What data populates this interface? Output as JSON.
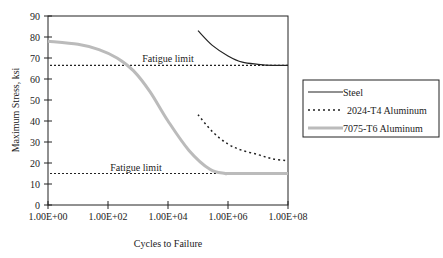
{
  "chart_data": {
    "type": "line",
    "title": "",
    "xlabel": "Cycles to Failure",
    "ylabel": "Maximum Stress, ksi",
    "x_scale": "log",
    "xlim": [
      1,
      100000000
    ],
    "ylim": [
      0,
      90
    ],
    "x_ticks": [
      "1.00E+00",
      "1.00E+02",
      "1.00E+04",
      "1.00E+06",
      "1.00E+08"
    ],
    "y_ticks": [
      0,
      10,
      20,
      30,
      40,
      50,
      60,
      70,
      80,
      90
    ],
    "grid": false,
    "legend_position": "right",
    "series": [
      {
        "name": "Steel",
        "style": "solid",
        "color": "#222222",
        "x": [
          100000,
          300000,
          1000000,
          3000000,
          10000000,
          30000000,
          100000000
        ],
        "y": [
          83,
          76,
          71,
          68,
          67,
          66.5,
          66.5
        ]
      },
      {
        "name": "2024-T4 Aluminum",
        "style": "dotted",
        "color": "#222222",
        "x": [
          100000,
          300000,
          1000000,
          3000000,
          10000000,
          30000000,
          100000000
        ],
        "y": [
          43,
          35,
          29,
          26,
          24,
          22,
          21
        ]
      },
      {
        "name": "7075-T6 Aluminum",
        "style": "solid-thick",
        "color": "#bbbbbb",
        "x": [
          1,
          10,
          50,
          200,
          700,
          2500,
          10000,
          50000,
          250000,
          800000,
          1000000,
          10000000,
          100000000
        ],
        "y": [
          78,
          76.5,
          74,
          70,
          64,
          54,
          40,
          26,
          17,
          15,
          15,
          15,
          15
        ]
      }
    ],
    "annotations": [
      {
        "text": "Fatigue limit",
        "y": 66.5,
        "style": "dotted-hline"
      },
      {
        "text": "Fatigue limit",
        "y": 15,
        "style": "dotted-hline"
      }
    ]
  }
}
